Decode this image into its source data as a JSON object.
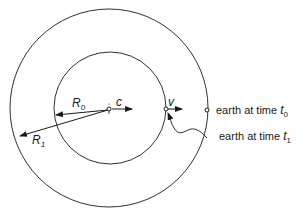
{
  "diagram": {
    "labels": {
      "R0": "R",
      "R0_sub": "0",
      "R1": "R",
      "R1_sub": "1",
      "c": "c",
      "v": "v",
      "earth_t0_text": "earth at time ",
      "earth_t0_var": "t",
      "earth_t0_sub": "0",
      "earth_t1_text": "earth at time ",
      "earth_t1_var": "t",
      "earth_t1_sub": "1"
    },
    "elements": [
      "outer-circle",
      "inner-circle",
      "center-point",
      "earth-t0-point",
      "earth-t1-point"
    ],
    "colors": {
      "stroke": "#1a1a1a",
      "background": "#ffffff"
    }
  }
}
